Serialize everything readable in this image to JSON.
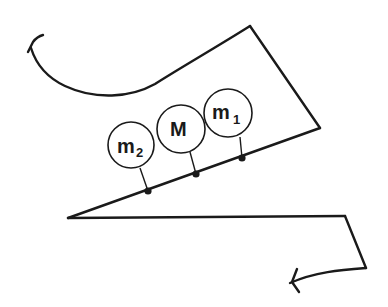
{
  "diagram": {
    "masses": [
      {
        "id": "m2",
        "label": "m",
        "subscript": "2"
      },
      {
        "id": "M",
        "label": "M",
        "subscript": ""
      },
      {
        "id": "m1",
        "label": "m",
        "subscript": "1"
      }
    ],
    "colors": {
      "ink": "#1a1a1a",
      "background": "#ffffff"
    }
  }
}
